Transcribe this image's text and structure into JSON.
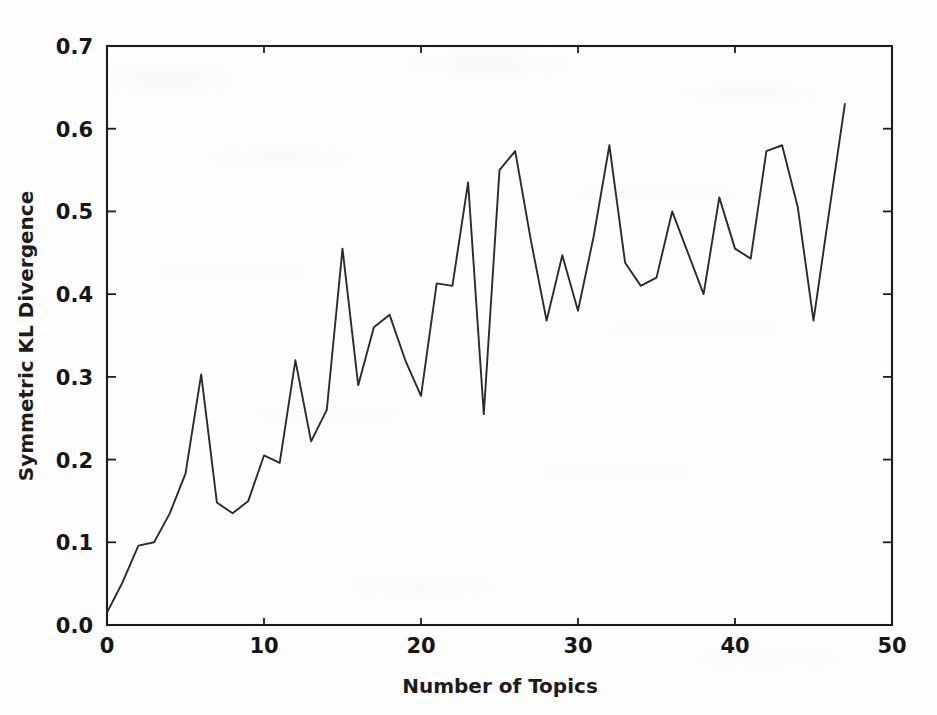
{
  "figure": {
    "background_color": "#fefefe",
    "line_color": "#2b2b2b",
    "axis_color": "#1c1c1c"
  },
  "chart_data": {
    "type": "line",
    "title": "",
    "xlabel": "Number of Topics",
    "ylabel": "Symmetric KL Divergence",
    "xlim": [
      0,
      50
    ],
    "ylim": [
      0.0,
      0.7
    ],
    "grid": false,
    "legend": null,
    "xticks": [
      0,
      10,
      20,
      30,
      40,
      50
    ],
    "xtick_labels": [
      "0",
      "10",
      "20",
      "30",
      "40",
      "50"
    ],
    "yticks": [
      0.0,
      0.1,
      0.2,
      0.3,
      0.4,
      0.5,
      0.6,
      0.7
    ],
    "ytick_labels": [
      "0.0",
      "0.1",
      "0.2",
      "0.3",
      "0.4",
      "0.5",
      "0.6",
      "0.7"
    ],
    "series": [
      {
        "name": "Symmetric KL Divergence",
        "x": [
          0,
          1,
          2,
          3,
          4,
          5,
          6,
          7,
          8,
          9,
          10,
          11,
          12,
          13,
          14,
          15,
          16,
          17,
          18,
          19,
          20,
          21,
          22,
          23,
          24,
          25,
          26,
          27,
          28,
          29,
          30,
          31,
          32,
          33,
          34,
          35,
          36,
          37,
          38,
          39,
          40,
          41,
          42,
          43,
          44,
          45,
          46,
          47
        ],
        "values": [
          0.015,
          0.052,
          0.096,
          0.1,
          0.135,
          0.183,
          0.303,
          0.148,
          0.135,
          0.15,
          0.205,
          0.196,
          0.32,
          0.222,
          0.26,
          0.455,
          0.29,
          0.36,
          0.375,
          0.32,
          0.277,
          0.413,
          0.41,
          0.535,
          0.255,
          0.55,
          0.573,
          0.465,
          0.368,
          0.447,
          0.38,
          0.47,
          0.58,
          0.438,
          0.41,
          0.42,
          0.5,
          0.45,
          0.4,
          0.517,
          0.455,
          0.443,
          0.573,
          0.58,
          0.505,
          0.368,
          0.5,
          0.63
        ]
      }
    ]
  }
}
